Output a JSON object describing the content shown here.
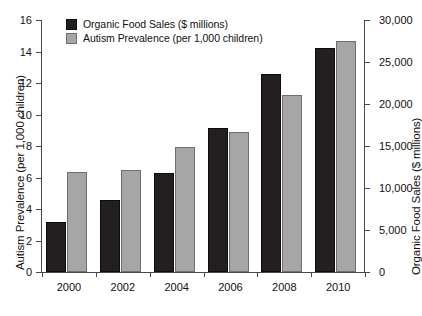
{
  "chart_data": {
    "type": "bar",
    "title": "",
    "subtitle": "",
    "categories": [
      "2000",
      "2002",
      "2004",
      "2006",
      "2008",
      "2010"
    ],
    "xlabel": "",
    "grid": false,
    "legend_position": "top-left",
    "series": [
      {
        "name": "Organic Food Sales ($ millions)",
        "color": "#231f20",
        "axis": "right",
        "values": [
          6000,
          8600,
          11800,
          17200,
          23600,
          26700
        ],
        "values_left_scale": [
          3.2,
          4.6,
          6.3,
          9.2,
          12.6,
          14.2
        ]
      },
      {
        "name": "Autism Prevalence (per 1,000 children)",
        "color": "#a6a6a6",
        "axis": "left",
        "values": [
          6.35,
          6.5,
          7.95,
          8.9,
          11.25,
          14.65
        ]
      }
    ],
    "y_left": {
      "label": "Autism Prevalence (per 1,000 children)",
      "ticks": [
        0,
        2,
        4,
        6,
        8,
        10,
        12,
        14,
        16
      ],
      "tick_labels": [
        "0",
        "2",
        "4",
        "6",
        "8",
        "10",
        "12",
        "14",
        "16"
      ],
      "ylim": [
        0,
        16
      ]
    },
    "y_right": {
      "label": "Organic Food Sales ($ millions)",
      "ticks": [
        0,
        5000,
        10000,
        15000,
        20000,
        25000,
        30000
      ],
      "tick_labels": [
        "0",
        "5,000",
        "10,000",
        "15,000",
        "20,000",
        "25,000",
        "30,000"
      ],
      "ylim": [
        0,
        30000
      ]
    }
  },
  "legend": {
    "items": [
      {
        "label": "Organic Food Sales ($ millions)"
      },
      {
        "label": "Autism Prevalence (per 1,000 children)"
      }
    ]
  },
  "caption": {
    "text": ""
  }
}
